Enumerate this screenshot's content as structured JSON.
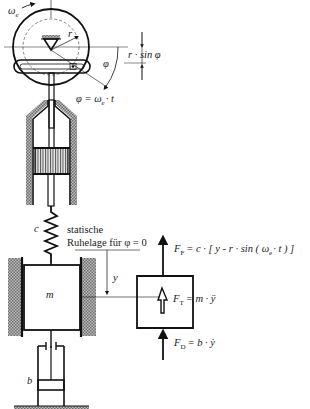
{
  "diagram": {
    "labels": {
      "omega_e": "ω",
      "omega_e_sub": "e",
      "r": "r",
      "r_sin_phi": "r · sin φ",
      "phi": "φ",
      "phi_eq": "φ = ω",
      "phi_eq_sub": "e",
      "phi_eq_tail": "· t",
      "c": "c",
      "static_line1": "statische",
      "static_line2": "Ruhelage für φ = 0",
      "y": "y",
      "m": "m",
      "b": "b"
    },
    "forces": {
      "spring": {
        "symbol": "F",
        "sub": "F",
        "expr": "= c · [ y - r · sin ( ω",
        "expr_sub": "e",
        "expr_tail": "· t ) ]"
      },
      "inertia": {
        "symbol": "F",
        "sub": "T",
        "expr": "= m · ÿ"
      },
      "damper": {
        "symbol": "F",
        "sub": "D",
        "expr": "= b · ẏ"
      }
    },
    "colors": {
      "line": "#111111",
      "hatch": "#8a8a8a",
      "background": "#ffffff"
    }
  }
}
